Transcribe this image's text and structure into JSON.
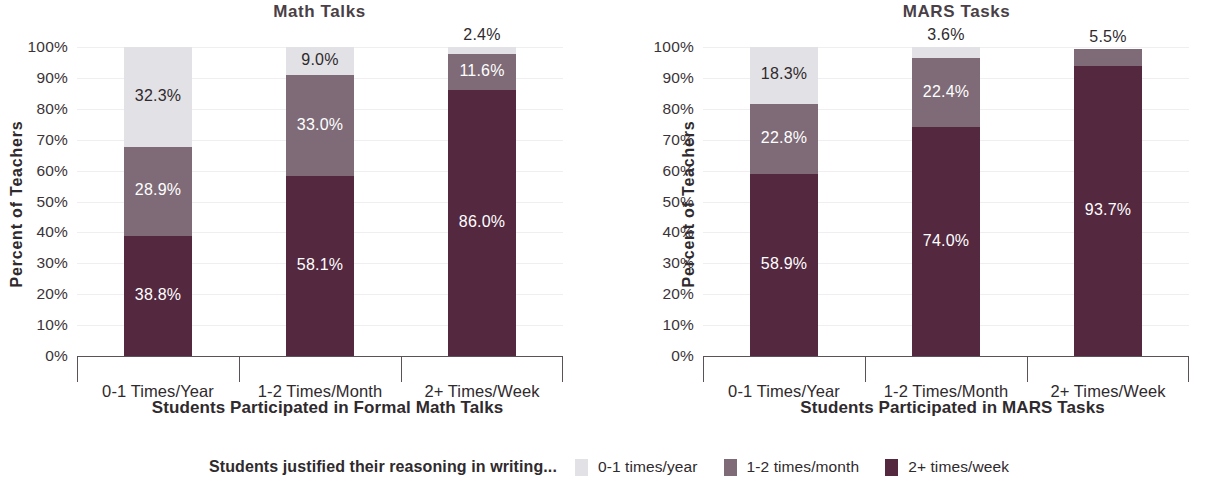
{
  "figure": {
    "y_axis_title": "Percent of Teachers"
  },
  "legend": {
    "caption": "Students justified their reasoning in writing...",
    "items": [
      {
        "label": "0-1 times/year",
        "color": "#e2e1e6"
      },
      {
        "label": "1-2 times/month",
        "color": "#7e6b77"
      },
      {
        "label": "2+ times/week",
        "color": "#54283f"
      }
    ]
  },
  "colors": {
    "series_light": "#e2e1e6",
    "series_medium": "#7e6b77",
    "series_dark": "#54283f",
    "axis": "#5b5257",
    "grid": "#f0eef0",
    "text": "#2f2a2d",
    "title": "#4a3f46"
  },
  "y_ticks": [
    "100%",
    "90%",
    "80%",
    "70%",
    "60%",
    "50%",
    "40%",
    "30%",
    "20%",
    "10%",
    "0%"
  ],
  "chart_data": [
    {
      "type": "bar",
      "subtype": "stacked-column-100",
      "title": "Math Talks",
      "xlabel": "Students Participated in Formal Math Talks",
      "ylabel": "Percent of Teachers",
      "ylim": [
        0,
        100
      ],
      "ytick_values": [
        0,
        10,
        20,
        30,
        40,
        50,
        60,
        70,
        80,
        90,
        100
      ],
      "grid": true,
      "legend_position": "bottom",
      "categories": [
        "0-1 Times/Year",
        "1-2 Times/Month",
        "2+ Times/Week"
      ],
      "series": [
        {
          "name": "2+ times/week",
          "color": "#54283f",
          "values": [
            38.8,
            58.1,
            86.0
          ],
          "labels": [
            "38.8%",
            "58.1%",
            "86.0%"
          ]
        },
        {
          "name": "1-2 times/month",
          "color": "#7e6b77",
          "values": [
            28.9,
            33.0,
            11.6
          ],
          "labels": [
            "28.9%",
            "33.0%",
            "11.6%"
          ]
        },
        {
          "name": "0-1 times/year",
          "color": "#e2e1e6",
          "values": [
            32.3,
            9.0,
            2.4
          ],
          "labels": [
            "32.3%",
            "9.0%",
            "2.4%"
          ]
        }
      ]
    },
    {
      "type": "bar",
      "subtype": "stacked-column-100",
      "title": "MARS Tasks",
      "xlabel": "Students Participated in MARS Tasks",
      "ylabel": "Percent of Teachers",
      "ylim": [
        0,
        100
      ],
      "ytick_values": [
        0,
        10,
        20,
        30,
        40,
        50,
        60,
        70,
        80,
        90,
        100
      ],
      "grid": true,
      "legend_position": "bottom",
      "categories": [
        "0-1 Times/Year",
        "1-2 Times/Month",
        "2+ Times/Week"
      ],
      "series": [
        {
          "name": "2+ times/week",
          "color": "#54283f",
          "values": [
            58.9,
            74.0,
            93.7
          ],
          "labels": [
            "58.9%",
            "74.0%",
            "93.7%"
          ]
        },
        {
          "name": "1-2 times/month",
          "color": "#7e6b77",
          "values": [
            22.8,
            22.4,
            5.5
          ],
          "labels": [
            "22.8%",
            "22.4%",
            "5.5%"
          ]
        },
        {
          "name": "0-1 times/year",
          "color": "#e2e1e6",
          "values": [
            18.3,
            3.6,
            0
          ],
          "labels": [
            "18.3%",
            "3.6%",
            ""
          ]
        }
      ]
    }
  ]
}
